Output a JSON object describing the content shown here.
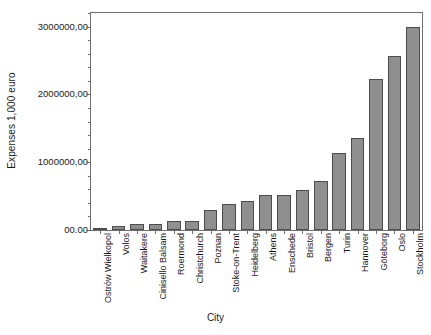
{
  "chart_data": {
    "type": "bar",
    "title": "",
    "xlabel": "City",
    "ylabel": "Expenses 1,000 euro",
    "categories": [
      "Ostrów Wielkopol",
      "Volos",
      "Waitakere",
      "Cinisello Balsam",
      "Roermond",
      "Christchurch",
      "Poznan",
      "Stoke-on-Trent",
      "Heidelberg",
      "Athens",
      "Enschede",
      "Bristol",
      "Bergen",
      "Turin",
      "Hannover",
      "Göteborg",
      "Oslo",
      "Stockholm"
    ],
    "values": [
      25000,
      60000,
      85000,
      95000,
      130000,
      140000,
      295000,
      390000,
      425000,
      510000,
      515000,
      595000,
      730000,
      1130000,
      1350000,
      2230000,
      2560000,
      3000000
    ],
    "ylim": [
      0,
      3200000
    ],
    "ytick_values": [
      0,
      1000000,
      2000000,
      3000000
    ],
    "ytick_labels": [
      "00.00",
      "1000000,00",
      "2000000,00",
      "3000000,00"
    ],
    "yminor_step": 200000,
    "grid": false,
    "legend": false,
    "bar_color": "#8f8f8f",
    "bar_edge_color": "#4d4d4d",
    "axis_color": "#6e6e6e",
    "text_color": "#1a1a1a",
    "background": "#ffffff"
  }
}
